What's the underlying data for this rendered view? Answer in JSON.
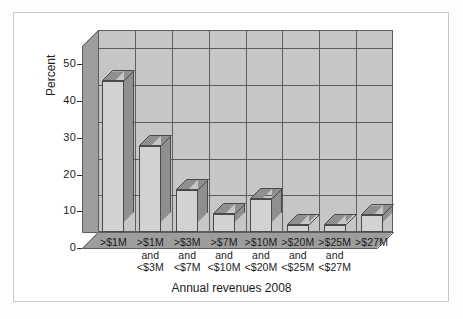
{
  "chart_data": {
    "type": "bar",
    "title": "",
    "xlabel": "Annual revenues 2008",
    "ylabel": "Percent",
    "categories": [
      "<$1M",
      ">$1M\nand\n<$3M",
      ">$3M\nand\n<$7M",
      ">$7M\nand\n<$10M",
      ">$10M\nand\n<$20M",
      ">$20M\nand\n<$25M",
      ">$25M\nand\n<$27M",
      ">$27M"
    ],
    "category_lines": [
      [
        ">$1M"
      ],
      [
        ">$1M",
        "and",
        "<$3M"
      ],
      [
        ">$3M",
        "and",
        "<$7M"
      ],
      [
        ">$7M",
        "and",
        "<$10M"
      ],
      [
        ">$10M",
        "and",
        "<$20M"
      ],
      [
        ">$20M",
        "and",
        "<$25M"
      ],
      [
        ">$25M",
        "and",
        "<$27M"
      ],
      [
        ">$27M"
      ]
    ],
    "values": [
      41,
      23.5,
      11.5,
      5,
      9,
      2,
      2,
      4.5
    ],
    "ylim": [
      0,
      55
    ],
    "yticks": [
      0,
      10,
      20,
      30,
      40,
      50
    ],
    "ytick_labels": [
      "0",
      "10",
      "20",
      "30",
      "40",
      "50"
    ],
    "grid": true,
    "legend": "none",
    "style": "3d-bar",
    "colors": {
      "bar_front": "#d2d2d2",
      "bar_side": "#8f8f8f",
      "wall": "#c6c6c6",
      "floor": "#9d9d9d",
      "outline": "#4a4a4a",
      "text": "#1c1c1c"
    }
  },
  "axis": {
    "y_title": "Percent",
    "x_title": "Annual revenues 2008"
  }
}
